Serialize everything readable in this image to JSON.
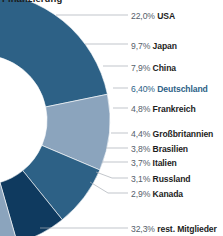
{
  "title": {
    "text": "Finanzierung"
  },
  "colors": {
    "segment_dark": "#2d6186",
    "segment_light": "#8ba4bd",
    "segment_highlight": "#0f3a5f",
    "label_percent": "#55606b",
    "label_name": "#1d1d1d",
    "label_highlight": "#2d6186",
    "leader_line": "#a8aeb4",
    "background": "#ffffff"
  },
  "chart_data": {
    "type": "pie",
    "title": "Finanzierung",
    "xlabel": "",
    "ylabel": "",
    "legend_position": "right-callout",
    "grid": false,
    "unit": "%",
    "decimal_separator": ",",
    "categories": [
      "USA",
      "Japan",
      "China",
      "Deutschland",
      "Frankreich",
      "Großbritannien",
      "Brasilien",
      "Italien",
      "Russland",
      "Kanada",
      "rest. Mitglieder"
    ],
    "values": [
      22.0,
      9.7,
      7.9,
      6.4,
      4.8,
      4.4,
      3.8,
      3.7,
      3.1,
      2.9,
      32.3
    ],
    "value_labels": [
      "22,0%",
      "9,7%",
      "7,9%",
      "6,40%",
      "4,8%",
      "4,4%",
      "3,8%",
      "3,7%",
      "3,1%",
      "2,9%",
      "32,3%"
    ],
    "slice_colors": [
      "#2d6186",
      "#8ba4bd",
      "#2d6186",
      "#0f3a5f",
      "#8ba4bd",
      "#2d6186",
      "#8ba4bd",
      "#2d6186",
      "#8ba4bd",
      "#2d6186",
      "#8ba4bd"
    ],
    "highlighted": "Deutschland"
  },
  "callouts": [
    {
      "percent": "22,0%",
      "name": "USA",
      "highlight": false
    },
    {
      "percent": "9,7%",
      "name": "Japan",
      "highlight": false
    },
    {
      "percent": "7,9%",
      "name": "China",
      "highlight": false
    },
    {
      "percent": "6,40%",
      "name": "Deutschland",
      "highlight": true
    },
    {
      "percent": "4,8%",
      "name": "Frankreich",
      "highlight": false
    },
    {
      "percent": "4,4%",
      "name": "Großbritannien",
      "highlight": false
    },
    {
      "percent": "3,8%",
      "name": "Brasilien",
      "highlight": false
    },
    {
      "percent": "3,7%",
      "name": "Italien",
      "highlight": false
    },
    {
      "percent": "3,1%",
      "name": "Russland",
      "highlight": false
    },
    {
      "percent": "2,9%",
      "name": "Kanada",
      "highlight": false
    },
    {
      "percent": "32,3%",
      "name": "rest. Mitglieder",
      "highlight": false
    }
  ]
}
